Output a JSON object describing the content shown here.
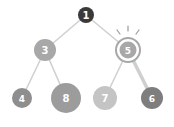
{
  "diagram": {
    "type": "binary-tree",
    "nodes": [
      {
        "id": "n1",
        "label": "1",
        "cx": 86,
        "cy": 15,
        "r": 8,
        "fill": "#3a3a3a",
        "font": 10
      },
      {
        "id": "n3",
        "label": "3",
        "cx": 45,
        "cy": 50,
        "r": 11,
        "fill": "#a8a8a8",
        "font": 10
      },
      {
        "id": "n5",
        "label": "5",
        "cx": 128,
        "cy": 50,
        "r": 9,
        "fill": "#a8a8a8",
        "font": 9,
        "highlighted": true
      },
      {
        "id": "n4",
        "label": "4",
        "cx": 22,
        "cy": 98,
        "r": 10,
        "fill": "#8e8e8e",
        "font": 9
      },
      {
        "id": "n8",
        "label": "8",
        "cx": 66,
        "cy": 98,
        "r": 15,
        "fill": "#9c9c9c",
        "font": 10
      },
      {
        "id": "n7",
        "label": "7",
        "cx": 105,
        "cy": 98,
        "r": 12,
        "fill": "#c4c4c4",
        "font": 10
      },
      {
        "id": "n6",
        "label": "6",
        "cx": 152,
        "cy": 98,
        "r": 11,
        "fill": "#7e7e7e",
        "font": 9
      }
    ],
    "edges": [
      {
        "from": "n1",
        "to": "n3",
        "width": 1.5
      },
      {
        "from": "n1",
        "to": "n5",
        "width": 1.5
      },
      {
        "from": "n3",
        "to": "n4",
        "width": 1.5
      },
      {
        "from": "n3",
        "to": "n8",
        "width": 1.5
      },
      {
        "from": "n5",
        "to": "n7",
        "width": 1.5
      },
      {
        "from": "n5",
        "to": "n6",
        "width": 3.5
      }
    ],
    "colors": {
      "edge": "#cfcfcf",
      "ring": "#a8a8a8",
      "spark": "#9a9a9a",
      "label": "#ffffff"
    }
  }
}
